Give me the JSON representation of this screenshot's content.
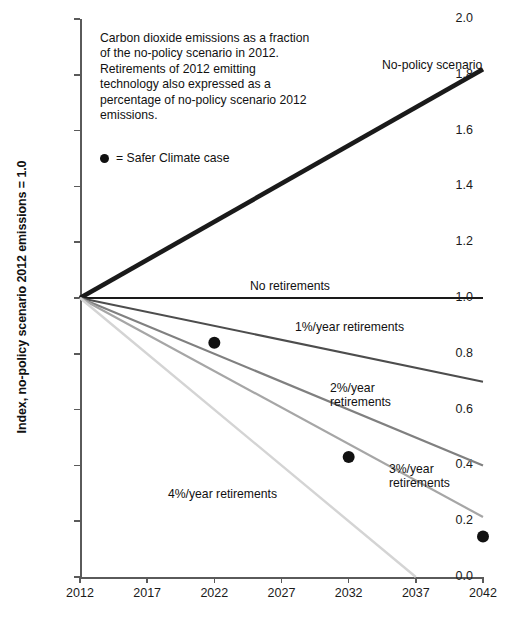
{
  "chart_data": {
    "type": "line",
    "title": "",
    "xlabel": "",
    "ylabel": "Index, no-policy scenario 2012 emissions = 1.0",
    "xlim": [
      2012,
      2042
    ],
    "ylim": [
      0.0,
      2.0
    ],
    "grid": false,
    "legend_position": "inline-labels",
    "x_ticks": [
      "2012",
      "2017",
      "2022",
      "2027",
      "2032",
      "2037",
      "2042"
    ],
    "y_ticks": [
      "0.0",
      "0.2",
      "0.4",
      "0.6",
      "0.8",
      "1.0",
      "1.2",
      "1.4",
      "1.6",
      "1.8",
      "2.0"
    ],
    "x": [
      2012,
      2042
    ],
    "series": [
      {
        "name": "No-policy scenario",
        "values": [
          1.0,
          1.82
        ],
        "color": "#1a1a1a",
        "width": 4.6
      },
      {
        "name": "No retirements",
        "values": [
          1.0,
          1.0
        ],
        "color": "#1a1a1a",
        "width": 2.0
      },
      {
        "name": "1%/year retirements",
        "values": [
          1.0,
          0.7
        ],
        "color": "#4d4d4d",
        "width": 2.0
      },
      {
        "name": "2%/year retirements",
        "values": [
          1.0,
          0.4
        ],
        "color": "#808080",
        "width": 2.2
      },
      {
        "name": "3%/year retirements",
        "values": [
          1.0,
          0.215
        ],
        "color": "#a6a6a6",
        "width": 2.2
      },
      {
        "name": "4%/year retirements",
        "values": [
          1.0,
          0.0
        ],
        "color": "#d4d4d4",
        "width": 2.4,
        "x_end": 2037
      }
    ],
    "scatter": {
      "name": "Safer Climate case",
      "marker": "filled-circle",
      "color": "#111111",
      "points": [
        {
          "x": 2022,
          "y": 0.84
        },
        {
          "x": 2032,
          "y": 0.43
        },
        {
          "x": 2042,
          "y": 0.145
        }
      ]
    },
    "annotation": "Carbon dioxide emissions as a fraction of the no-policy scenario in 2012.  Retirements of 2012 emitting technology also expressed as a percentage of no-policy scenario 2012 emissions.",
    "legend_text": "= Safer Climate case",
    "series_labels": {
      "no_policy": "No-policy scenario",
      "no_retirements": "No retirements",
      "one_pct": "1%/year retirements",
      "two_pct_line1": "2%/year",
      "two_pct_line2": "retirements",
      "three_pct_line1": "3%/year",
      "three_pct_line2": "retirements",
      "four_pct": "4%/year retirements"
    }
  }
}
